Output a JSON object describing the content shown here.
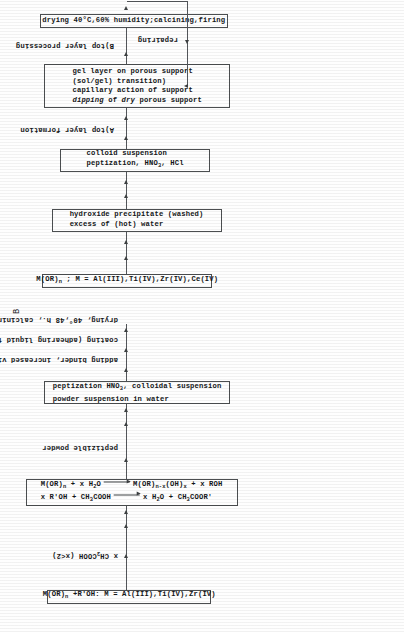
{
  "figure": {
    "section_b_tag": "B",
    "bg_color": "#fefefe",
    "line_color": "#53565a"
  },
  "chart_b": {
    "label": "B",
    "boxes": [
      {
        "name": "precursor-box",
        "lines": [
          "M(OR)n ; M = Al(III),Ti(IV),Zr(IV),Ce(IV)"
        ]
      },
      {
        "name": "hydrolysis-box",
        "lines": [
          "excess of (hot) water",
          "hydroxide precipitate (washed)"
        ]
      },
      {
        "name": "peptization-box",
        "lines": [
          "peptization, HNO3, HCl",
          "colloid suspension"
        ]
      },
      {
        "name": "dipping-box",
        "lines": [
          "dipping of dry porous support",
          "capillary action of support",
          "(sol/gel) transition)",
          "gel layer on porous support"
        ]
      },
      {
        "name": "drying-box",
        "lines": [
          "drying 40°C,60% humidity;calcining,firing"
        ]
      }
    ],
    "stage_labels": [
      {
        "name": "stage-a-label",
        "text": "A)top layer formation"
      },
      {
        "name": "stage-b-label",
        "text": "B)top layer processing"
      }
    ],
    "feedback_label": "repairing"
  },
  "chart_a": {
    "boxes": [
      {
        "name": "precursor-box",
        "lines": [
          "M(OR)n +R'OH: M = Al(III),Ti(IV),Zr(IV)"
        ]
      },
      {
        "name": "reaction-box",
        "lines": [
          "x R'OH + CH3COOH  ⟶  x H2O + CH3COOR'",
          "M(OR)n + x H2O  ⟶  M(OR)n-x(OH)x + x ROH"
        ]
      },
      {
        "name": "suspension-box",
        "lines": [
          "powder suspension in water",
          "peptization HNO3, colloidal suspension"
        ]
      }
    ],
    "step_labels": [
      {
        "name": "acid-label",
        "text": "x CH3COOH (x<2)"
      },
      {
        "name": "powder-label",
        "text": "peptizible powder"
      },
      {
        "name": "binder-label",
        "text": "adding binder, increased viscosity"
      },
      {
        "name": "coating-label",
        "text": "coating (adhearing liquid film)"
      },
      {
        "name": "firing-label",
        "text": "drying, 40°,48 h., calcining, firing"
      }
    ]
  }
}
